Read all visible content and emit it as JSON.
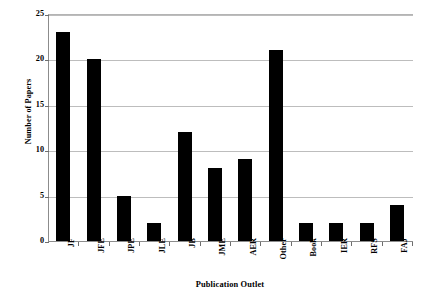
{
  "chart_data": {
    "type": "bar",
    "title": "",
    "subtitle": "",
    "xlabel": "Publication Outlet",
    "ylabel": "Number of Papers",
    "categories": [
      "JF",
      "JFE",
      "JPE",
      "JLE",
      "JB",
      "JME",
      "AER",
      "Other",
      "Book",
      "IER",
      "RFS",
      "FAJ"
    ],
    "values": [
      23,
      20,
      5,
      2,
      12,
      8,
      9,
      21,
      2,
      2,
      2,
      4
    ],
    "ylim": [
      0,
      25
    ],
    "yticks": [
      0,
      5,
      10,
      15,
      20,
      25
    ],
    "ytick_labels": [
      "0",
      "5",
      "10",
      "15",
      "20",
      "25"
    ],
    "grid": "horizontal",
    "legend": "none",
    "bar_color": "#000000",
    "grid_color": "#bdbdbd",
    "axis_color": "#8c8c8c",
    "background": "#ffffff"
  }
}
